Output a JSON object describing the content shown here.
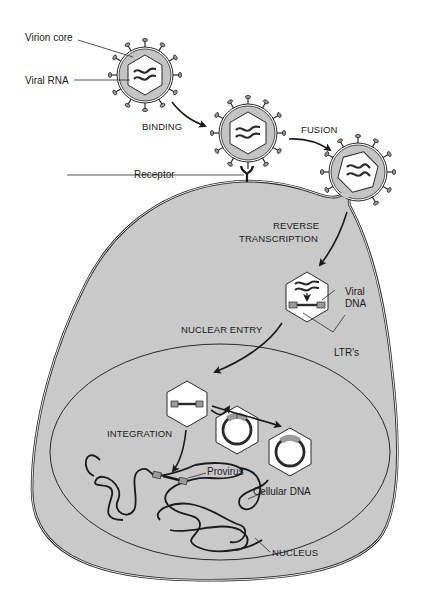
{
  "diagram": {
    "colors": {
      "cytoplasm": "#c9c9c9",
      "capsid_fill": "#ffffff",
      "envelope": "#bdbdbd",
      "stroke": "#2a2a2a",
      "ltr": "#9a9a9a"
    },
    "labels": {
      "virion_core": "Virion core",
      "viral_rna": "Viral RNA",
      "receptor": "Receptor",
      "viral_dna_line1": "Viral",
      "viral_dna_line2": "DNA",
      "ltrs": "LTR's",
      "provirus": "Provirus",
      "cellular_dna": "Cellular DNA",
      "nucleus": "NUCLEUS"
    },
    "steps": {
      "binding": "BINDING",
      "fusion": "FUSION",
      "reverse_transcription_line1": "REVERSE",
      "reverse_transcription_line2": "TRANSCRIPTION",
      "nuclear_entry": "NUCLEAR ENTRY",
      "integration": "INTEGRATION"
    }
  }
}
